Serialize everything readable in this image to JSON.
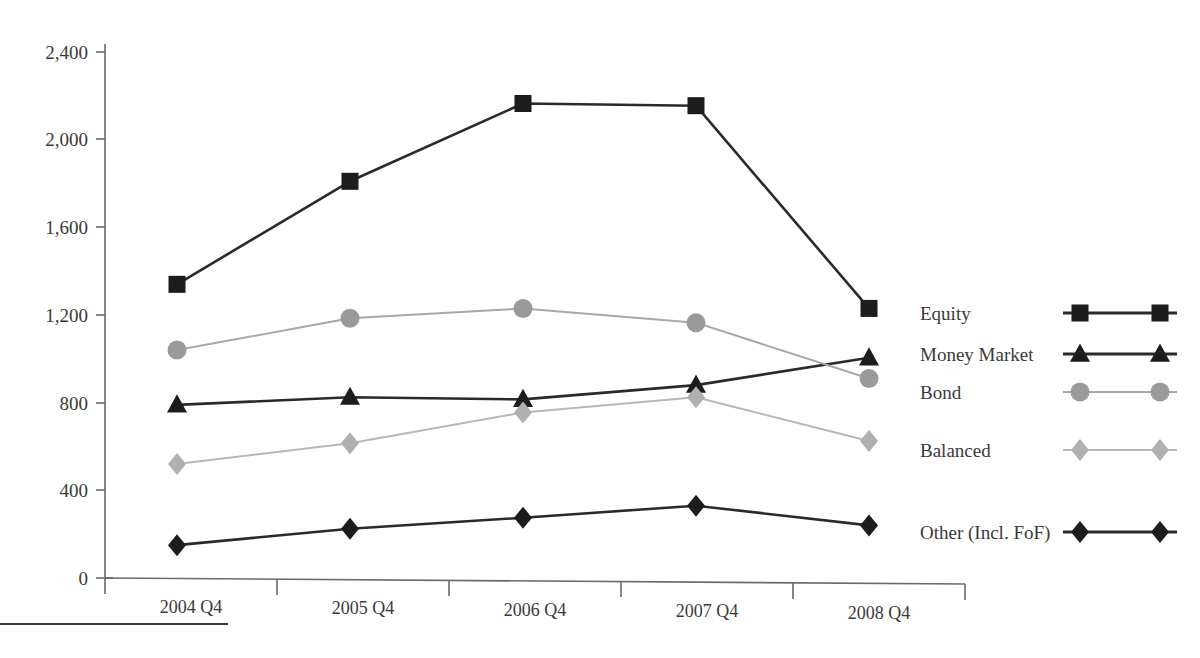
{
  "chart_data": {
    "type": "line",
    "title": "",
    "subtitle": "",
    "xlabel": "",
    "ylabel": "",
    "categories": [
      "2004 Q4",
      "2005 Q4",
      "2006 Q4",
      "2007 Q4",
      "2008 Q4"
    ],
    "ylim": [
      0,
      2400
    ],
    "yticks": [
      0,
      400,
      800,
      1200,
      1600,
      2000,
      2400
    ],
    "ytick_labels": [
      "0",
      "400",
      "800",
      "1,200",
      "1,600",
      "2,000",
      "2,400"
    ],
    "grid": false,
    "legend_position": "right",
    "series": [
      {
        "name": "Equity",
        "marker": "square",
        "color": "#1c1c1c",
        "line_color": "#2a2a2a",
        "values": [
          1340,
          1810,
          2165,
          2155,
          1230
        ]
      },
      {
        "name": "Money Market",
        "marker": "triangle",
        "color": "#1c1c1c",
        "line_color": "#2a2a2a",
        "values": [
          790,
          825,
          815,
          880,
          1005
        ]
      },
      {
        "name": "Bond",
        "marker": "circle",
        "color": "#9a9a9a",
        "line_color": "#a8a8a8",
        "values": [
          1040,
          1185,
          1230,
          1165,
          910
        ]
      },
      {
        "name": "Balanced",
        "marker": "diamond",
        "color": "#b0b0b0",
        "line_color": "#b8b8b8",
        "values": [
          520,
          615,
          755,
          825,
          625
        ]
      },
      {
        "name": "Other (Incl. FoF)",
        "marker": "diamond",
        "color": "#1c1c1c",
        "line_color": "#2a2a2a",
        "values": [
          150,
          225,
          275,
          330,
          240
        ]
      }
    ]
  },
  "axis": {
    "y_tick_labels": [
      "2,400",
      "2,000",
      "1,600",
      "1,200",
      "800",
      "400",
      "0"
    ],
    "x_tick_labels": [
      "2004 Q4",
      "2005 Q4",
      "2006 Q4",
      "2007 Q4",
      "2008 Q4"
    ]
  },
  "legend": {
    "items": [
      {
        "label": "Equity",
        "marker": "square-marker",
        "color": "#1c1c1c"
      },
      {
        "label": "Money Market",
        "marker": "triangle-marker",
        "color": "#1c1c1c"
      },
      {
        "label": "Bond",
        "marker": "circle-marker",
        "color": "#9a9a9a"
      },
      {
        "label": "Balanced",
        "marker": "diamond-marker",
        "color": "#b0b0b0"
      },
      {
        "label": "Other (Incl. FoF)",
        "marker": "diamond-marker",
        "color": "#1c1c1c"
      }
    ]
  }
}
